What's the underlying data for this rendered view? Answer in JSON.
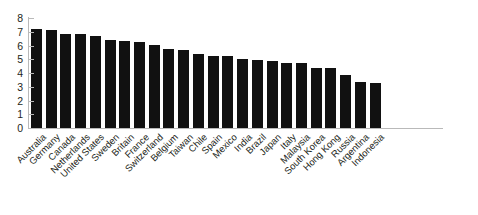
{
  "chart_data": {
    "type": "bar",
    "title": "",
    "subtitle": "",
    "xlabel": "",
    "ylabel": "",
    "ylim": [
      0,
      8
    ],
    "y_ticks": [
      0,
      1,
      2,
      3,
      4,
      5,
      6,
      7,
      8
    ],
    "grid": false,
    "legend": false,
    "legend_position": "none",
    "bar_color": "#111111",
    "axis_color": "#b9b9b9",
    "text_color": "#231f20",
    "background": "#ffffff",
    "x_tick_rotation": -45,
    "categories": [
      "Australia",
      "Germany",
      "Canada",
      "Netherlands",
      "United States",
      "Sweden",
      "Britain",
      "France",
      "Switzerland",
      "Belgium",
      "Taiwan",
      "Chile",
      "Spain",
      "Mexico",
      "India",
      "Brazil",
      "Japan",
      "Italy",
      "Malaysia",
      "South Korea",
      "Hong Kong",
      "Russia",
      "Argentina",
      "Indonesia"
    ],
    "values": [
      7.2,
      7.1,
      6.85,
      6.85,
      6.7,
      6.4,
      6.3,
      6.25,
      6.05,
      5.75,
      5.65,
      5.4,
      5.25,
      5.25,
      5.05,
      4.95,
      4.9,
      4.7,
      4.7,
      4.4,
      4.4,
      3.85,
      3.35,
      3.25
    ]
  }
}
